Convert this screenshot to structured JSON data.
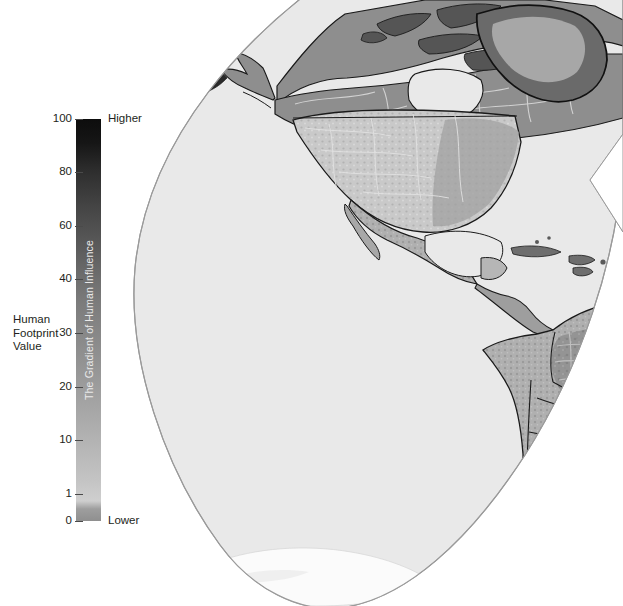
{
  "figure": {
    "kind": "thematic-world-map",
    "projection": "interrupted-goode-homolosine",
    "hemisphere_shown": "western (Americas lobe)"
  },
  "legend": {
    "axis_title_lines": [
      "Human",
      "Footprint",
      "Value"
    ],
    "colorbar_caption": "The Gradient of Human Influence",
    "high_end_label": "Higher",
    "low_end_label": "Lower",
    "ticks": [
      {
        "label": "100",
        "value": 100,
        "y": 119
      },
      {
        "label": "80",
        "value": 80,
        "y": 172
      },
      {
        "label": "60",
        "value": 60,
        "y": 226
      },
      {
        "label": "40",
        "value": 40,
        "y": 279
      },
      {
        "label": "30",
        "value": 30,
        "y": 333
      },
      {
        "label": "20",
        "value": 20,
        "y": 387
      },
      {
        "label": "10",
        "value": 10,
        "y": 440
      },
      {
        "label": "1",
        "value": 1,
        "y": 494
      },
      {
        "label": "0",
        "value": 0,
        "y": 521
      }
    ],
    "colors": {
      "high": "#0d0d0d",
      "mid": "#8a8a8a",
      "low": "#cfcfcf",
      "caption_text": "#e9e9e9",
      "tick_text": "#231f20",
      "tick_mark": "#4a4a4a"
    }
  },
  "map": {
    "colors": {
      "ocean": "#e9e9e9",
      "ocean_outline": "#9a9a9a",
      "land_light": "#d2d2d2",
      "land_mid": "#b4b4b4",
      "land_dark": "#8e8e8e",
      "land_darker": "#7a7a7a",
      "border": "#1a1a1a",
      "ice": "#f4f4f4",
      "interruption": "#ffffff"
    },
    "regions_visible": [
      "Alaska",
      "Canada",
      "Greenland",
      "United States",
      "Mexico",
      "Central America",
      "Caribbean",
      "Colombia",
      "Venezuela",
      "Brazil",
      "Peru",
      "Bolivia",
      "Chile",
      "Argentina",
      "Antarctic margin"
    ]
  }
}
